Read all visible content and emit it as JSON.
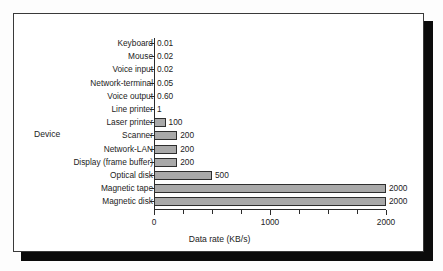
{
  "chart_data": {
    "type": "bar",
    "orientation": "horizontal",
    "title": "",
    "xlabel": "Data rate (KB/s)",
    "ylabel": "Device",
    "xlim": [
      0,
      2000
    ],
    "xticks": [
      0,
      250,
      500,
      750,
      1000,
      1250,
      1500,
      1750,
      2000
    ],
    "xticklabels": [
      "0",
      "",
      "",
      "",
      "1000",
      "",
      "",
      "",
      "2000"
    ],
    "grid": false,
    "legend": null,
    "categories": [
      "Keyboard",
      "Mouse",
      "Voice input",
      "Network-terminal",
      "Voice output",
      "Line printer",
      "Laser printer",
      "Scanner",
      "Network-LAN",
      "Display (frame buffer)",
      "Optical disk",
      "Magnetic tape",
      "Magnetic disk"
    ],
    "values": [
      0.01,
      0.02,
      0.02,
      0.05,
      0.6,
      1,
      100,
      200,
      200,
      200,
      500,
      2000,
      2000
    ],
    "value_labels": [
      "0.01",
      "0.02",
      "0.02",
      "0.05",
      "0.60",
      "1",
      "100",
      "200",
      "200",
      "200",
      "500",
      "2000",
      "2000"
    ],
    "bar_fill": "#a9a9a9",
    "bar_edge": "#2e2e2e"
  },
  "figure": {
    "background": "#ffffff",
    "frame_color": "#3a3a3a",
    "shadow_color": "#0b0b0b"
  }
}
